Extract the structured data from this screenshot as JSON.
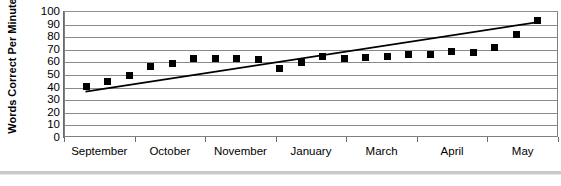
{
  "chart_data": {
    "type": "scatter",
    "title": "",
    "xlabel": "",
    "ylabel": "Words Correct Per Minute",
    "ylim": [
      0,
      100
    ],
    "ytick_labels": [
      "100",
      "90",
      "80",
      "70",
      "60",
      "50",
      "40",
      "30",
      "20",
      "10",
      "0"
    ],
    "ytick_values": [
      100,
      90,
      80,
      70,
      60,
      50,
      40,
      30,
      20,
      10,
      0
    ],
    "categories": [
      "September",
      "October",
      "November",
      "January",
      "March",
      "April",
      "May"
    ],
    "grid": true,
    "legend": "none",
    "series": [
      {
        "name": "Words Correct Per Minute",
        "marker": "square",
        "color": "#000000",
        "x": [
          1,
          2,
          3,
          4,
          5,
          6,
          7,
          8,
          9,
          10,
          11,
          12,
          13,
          14,
          15,
          16,
          17,
          18,
          19,
          20,
          21,
          22
        ],
        "values": [
          41,
          45,
          50,
          57,
          59,
          63,
          63,
          63,
          62,
          55,
          60,
          65,
          63,
          64,
          65,
          66,
          66,
          69,
          68,
          72,
          82,
          93
        ]
      }
    ],
    "trendline": {
      "name": "linear trendline",
      "color": "#000000",
      "x_start": 1,
      "y_start": 36,
      "x_end": 22,
      "y_end": 91
    }
  },
  "figure": {
    "background_color": "#ffffff",
    "grid_color": "#8a8a8a",
    "axis_color": "#6b6b6b",
    "marker_color": "#000000"
  }
}
